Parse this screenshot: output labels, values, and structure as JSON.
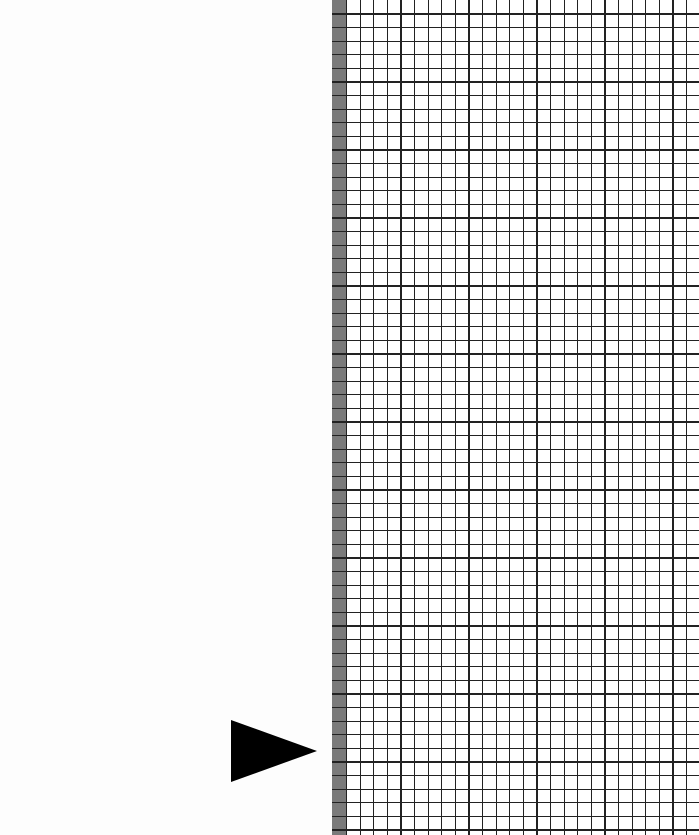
{
  "canvas": {
    "width": 699,
    "height": 835
  },
  "left_panel": {
    "background_color": "#fdfdfd"
  },
  "play_arrow": {
    "icon": "play-triangle-icon",
    "color": "#000000"
  },
  "grid": {
    "cell_size_px": 13.6,
    "line_color": "#222222",
    "background_color": "#ffffff",
    "margin_strip_color": "#7a7a7a"
  }
}
